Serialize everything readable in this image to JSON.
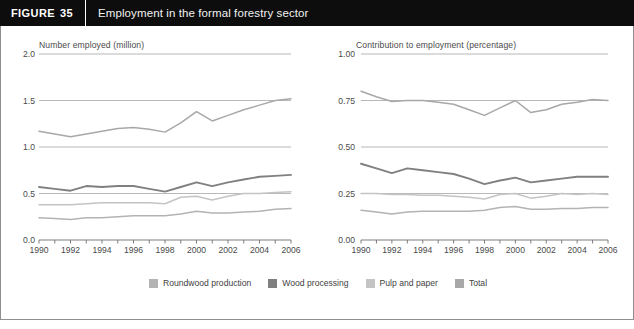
{
  "header": {
    "figure_word": "FIGURE",
    "figure_number": "35",
    "title": "Employment in the formal forestry sector"
  },
  "legend": {
    "items": [
      {
        "label": "Roundwood production",
        "color": "#b3b3b3"
      },
      {
        "label": "Wood processing",
        "color": "#808080"
      },
      {
        "label": "Pulp and paper",
        "color": "#c4c4c4"
      },
      {
        "label": "Total",
        "color": "#a8a8a8"
      }
    ]
  },
  "colors": {
    "roundwood": "#b3b3b3",
    "wood_processing": "#808080",
    "pulp_paper": "#c4c4c4",
    "total": "#a8a8a8",
    "gridline": "#9a9a9a",
    "axis": "#6f6f6f",
    "text": "#4a4a4a",
    "header_bg": "#0d0d0d",
    "border": "#8e8e8e"
  },
  "chart_data": [
    {
      "id": "left",
      "type": "line",
      "title": "Number employed (million)",
      "xlabel": "",
      "ylabel": "Number employed (million)",
      "x": [
        1990,
        1991,
        1992,
        1993,
        1994,
        1995,
        1996,
        1997,
        1998,
        1999,
        2000,
        2001,
        2002,
        2003,
        2004,
        2005,
        2006
      ],
      "xlim": [
        1990,
        2006
      ],
      "ylim": [
        0.0,
        2.0
      ],
      "yticks": [
        0.0,
        0.5,
        1.0,
        1.5,
        2.0
      ],
      "ytick_labels": [
        "0.0",
        "0.5",
        "1.0",
        "1.5",
        "2.0"
      ],
      "xticks": [
        1990,
        1991,
        1992,
        1993,
        1994,
        1995,
        1996,
        1997,
        1998,
        1999,
        2000,
        2001,
        2002,
        2003,
        2004,
        2005,
        2006
      ],
      "xtick_labels": [
        "1990",
        "",
        "1992",
        "",
        "1994",
        "",
        "1996",
        "",
        "1998",
        "",
        "2000",
        "",
        "2002",
        "",
        "2004",
        "",
        "2006"
      ],
      "grid": true,
      "series": [
        {
          "name": "Total",
          "color": "#a8a8a8",
          "values": [
            1.17,
            1.14,
            1.11,
            1.14,
            1.17,
            1.2,
            1.21,
            1.19,
            1.16,
            1.26,
            1.38,
            1.28,
            1.34,
            1.4,
            1.45,
            1.5,
            1.52
          ]
        },
        {
          "name": "Wood processing",
          "color": "#808080",
          "values": [
            0.57,
            0.55,
            0.53,
            0.58,
            0.57,
            0.58,
            0.58,
            0.55,
            0.52,
            0.57,
            0.62,
            0.58,
            0.62,
            0.65,
            0.68,
            0.69,
            0.7
          ]
        },
        {
          "name": "Pulp and paper",
          "color": "#c4c4c4",
          "values": [
            0.38,
            0.38,
            0.38,
            0.39,
            0.4,
            0.4,
            0.4,
            0.4,
            0.39,
            0.46,
            0.47,
            0.43,
            0.47,
            0.5,
            0.5,
            0.51,
            0.52
          ]
        },
        {
          "name": "Roundwood production",
          "color": "#b3b3b3",
          "values": [
            0.24,
            0.23,
            0.22,
            0.24,
            0.24,
            0.25,
            0.26,
            0.26,
            0.26,
            0.28,
            0.31,
            0.29,
            0.29,
            0.3,
            0.31,
            0.33,
            0.34
          ]
        }
      ]
    },
    {
      "id": "right",
      "type": "line",
      "title": "Contribution to employment (percentage)",
      "xlabel": "",
      "ylabel": "Contribution to employment (percentage)",
      "x": [
        1990,
        1991,
        1992,
        1993,
        1994,
        1995,
        1996,
        1997,
        1998,
        1999,
        2000,
        2001,
        2002,
        2003,
        2004,
        2005,
        2006
      ],
      "xlim": [
        1990,
        2006
      ],
      "ylim": [
        0.0,
        1.0
      ],
      "yticks": [
        0.0,
        0.25,
        0.5,
        0.75,
        1.0
      ],
      "ytick_labels": [
        "0.00",
        "0.25",
        "0.50",
        "0.75",
        "1.00"
      ],
      "xticks": [
        1990,
        1991,
        1992,
        1993,
        1994,
        1995,
        1996,
        1997,
        1998,
        1999,
        2000,
        2001,
        2002,
        2003,
        2004,
        2005,
        2006
      ],
      "xtick_labels": [
        "1990",
        "",
        "1992",
        "",
        "1994",
        "",
        "1996",
        "",
        "1998",
        "",
        "2000",
        "",
        "2002",
        "",
        "2004",
        "",
        "2006"
      ],
      "grid": true,
      "series": [
        {
          "name": "Total",
          "color": "#a8a8a8",
          "values": [
            0.8,
            0.77,
            0.745,
            0.75,
            0.75,
            0.74,
            0.73,
            0.7,
            0.67,
            0.71,
            0.75,
            0.685,
            0.7,
            0.73,
            0.74,
            0.755,
            0.75
          ]
        },
        {
          "name": "Wood processing",
          "color": "#808080",
          "values": [
            0.41,
            0.385,
            0.36,
            0.385,
            0.375,
            0.365,
            0.355,
            0.33,
            0.3,
            0.32,
            0.335,
            0.31,
            0.32,
            0.33,
            0.34,
            0.34,
            0.34
          ]
        },
        {
          "name": "Pulp and paper",
          "color": "#c4c4c4",
          "values": [
            0.25,
            0.25,
            0.245,
            0.245,
            0.24,
            0.24,
            0.235,
            0.23,
            0.22,
            0.245,
            0.25,
            0.225,
            0.235,
            0.25,
            0.245,
            0.25,
            0.245
          ]
        },
        {
          "name": "Roundwood production",
          "color": "#b3b3b3",
          "values": [
            0.16,
            0.15,
            0.14,
            0.15,
            0.155,
            0.155,
            0.155,
            0.155,
            0.16,
            0.175,
            0.18,
            0.165,
            0.165,
            0.17,
            0.17,
            0.175,
            0.175
          ]
        }
      ]
    }
  ]
}
